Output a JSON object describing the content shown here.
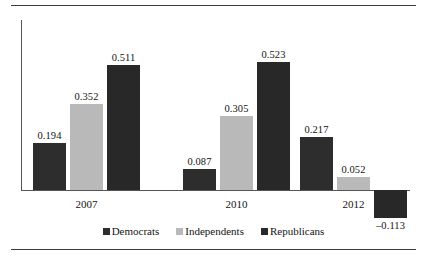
{
  "chart_data": {
    "type": "bar",
    "title": "",
    "subtitle": "",
    "xlabel": "",
    "ylabel": "",
    "categories": [
      "2007",
      "2010",
      "2012"
    ],
    "series": [
      {
        "name": "Democrats",
        "color": "#2d2d2d",
        "values": [
          0.194,
          0.087,
          0.217
        ]
      },
      {
        "name": "Independents",
        "color": "#b9b9b9",
        "values": [
          0.352,
          0.305,
          0.052
        ]
      },
      {
        "name": "Republicans",
        "color": "#282828",
        "values": [
          0.511,
          0.523,
          -0.113
        ]
      }
    ],
    "data_labels": [
      [
        "0.194",
        "0.352",
        "0.511"
      ],
      [
        "0.087",
        "0.305",
        "0.523"
      ],
      [
        "0.217",
        "0.052",
        "–0.113"
      ]
    ],
    "ylim": [
      -0.2,
      0.6
    ],
    "grid": false,
    "axis_visible": {
      "x": true,
      "y": true
    },
    "legend": {
      "position": "bottom",
      "entries": [
        "Democrats",
        "Independents",
        "Republicans"
      ]
    }
  },
  "frame": {
    "top_rule": true,
    "bottom_rule": true
  }
}
